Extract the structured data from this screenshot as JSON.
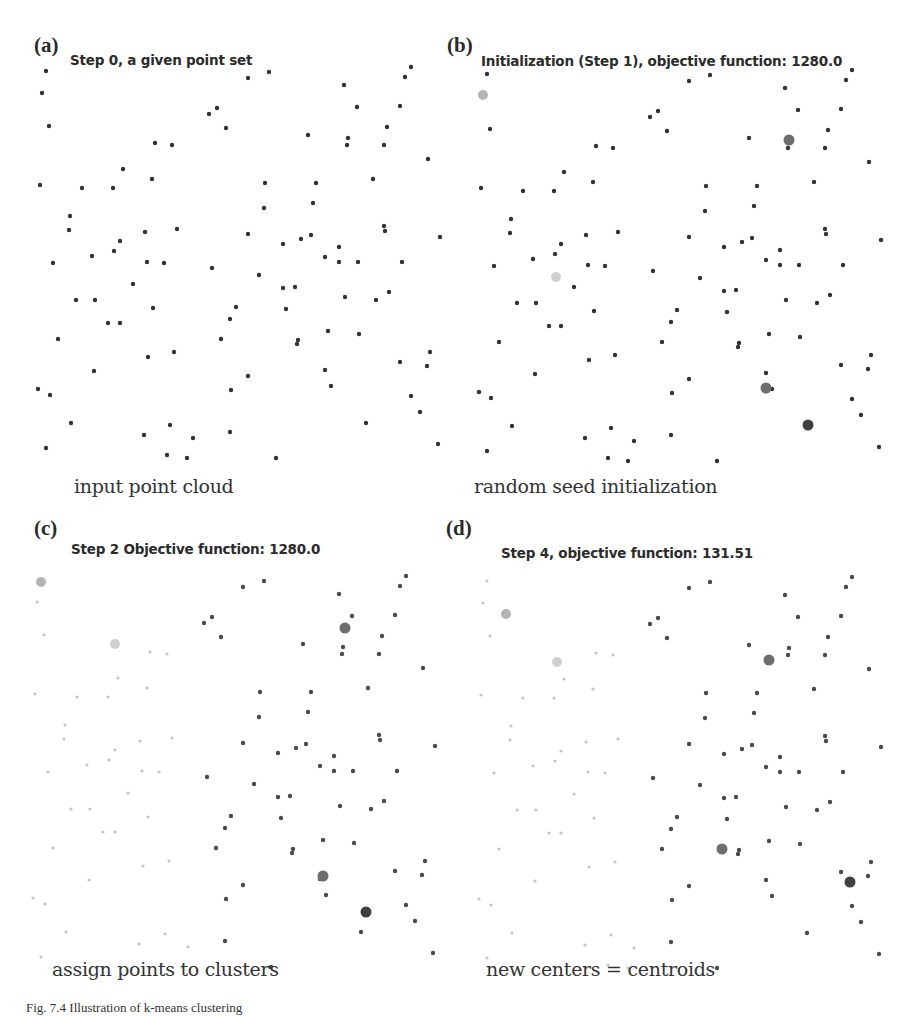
{
  "figure": {
    "panels": [
      {
        "letter": "(a)",
        "title": "Step 0, a given point set",
        "caption": "input point cloud"
      },
      {
        "letter": "(b)",
        "title": "Initialization (Step 1), objective function: 1280.0",
        "caption": "random seed initialization"
      },
      {
        "letter": "(c)",
        "title": "Step 2  Objective function: 1280.0",
        "caption": "assign points to clusters"
      },
      {
        "letter": "(d)",
        "title": "Step 4, objective function: 131.51",
        "caption": "new centers = centroids"
      }
    ],
    "figure_caption": "Fig. 7.4  Illustration of k-means clustering"
  },
  "colors": {
    "point_default": "#333333",
    "cluster_1": "#b4b4b4",
    "cluster_2": "#d0d0d0",
    "cluster_3": "#6e6e6e",
    "cluster_4": "#404040",
    "cluster_points_light": "#c4c4c4",
    "cluster_points_dark": "#4a4a4a"
  },
  "chart_data": [
    {
      "type": "scatter",
      "title": "Step 0, a given point set",
      "subtitle": "input point cloud",
      "k": 0,
      "centers": []
    },
    {
      "type": "scatter",
      "title": "Initialization (Step 1), objective function: 1280.0",
      "subtitle": "random seed initialization",
      "objective_function": 1280.0,
      "k": 4,
      "centers": [
        {
          "x": 42,
          "y": 93,
          "shade": "light-gray"
        },
        {
          "x": 116,
          "y": 275,
          "shade": "very-light-gray"
        },
        {
          "x": 349,
          "y": 138,
          "shade": "dark-gray"
        },
        {
          "x": 326,
          "y": 386,
          "shade": "darkest"
        },
        {
          "x": 367,
          "y": 423,
          "shade": "darkest"
        }
      ]
    },
    {
      "type": "scatter",
      "title": "Step 2  Objective function: 1280.0",
      "subtitle": "assign points to clusters",
      "objective_function": 1280.0,
      "k": 4
    },
    {
      "type": "scatter",
      "title": "Step 4, objective function: 131.51",
      "subtitle": "new centers = centroids",
      "objective_function": 131.51,
      "k": 4
    }
  ]
}
